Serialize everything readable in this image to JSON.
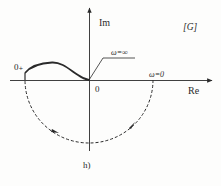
{
  "figure": {
    "caption": "h)",
    "plane_label": "[G]",
    "axes": {
      "real_label": "Re",
      "imag_label": "Im",
      "origin_label": "0"
    },
    "annotations": {
      "start_point": "0₊",
      "omega_infinity": "ω=∞",
      "omega_zero": "ω=0"
    },
    "curves": {
      "solid": "Nyquist plot branch from 0₊ (negative real axis, slightly above) to origin at ω=∞",
      "dashed": "Clockwise semicircle of infinite radius from ω=0 on positive real axis, through lower half-plane, to 0₊ on negative real axis"
    },
    "colors": {
      "line": "#2a2a2a",
      "background": "#fdfdfc"
    }
  }
}
